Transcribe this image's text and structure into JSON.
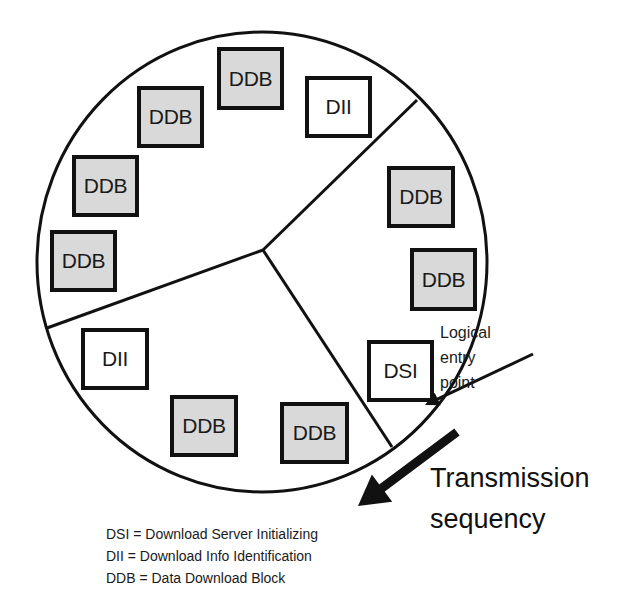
{
  "diagram": {
    "colors": {
      "stroke": "#111111",
      "shaded_block": "#d9d9d9",
      "plain_block": "#ffffff",
      "background": "#ffffff"
    },
    "wheel": {
      "cx": 262,
      "cy": 262,
      "rx": 225,
      "ry": 230,
      "hub": {
        "x": 263,
        "y": 250
      },
      "dividers": [
        {
          "x": 417,
          "y": 100
        },
        {
          "x": 47,
          "y": 328
        },
        {
          "x": 392,
          "y": 447
        }
      ]
    },
    "blocks": [
      {
        "label": "DDB",
        "type": "shaded",
        "x": 217,
        "y": 47,
        "w": 67,
        "h": 63
      },
      {
        "label": "DII",
        "type": "plain",
        "x": 305,
        "y": 76,
        "w": 67,
        "h": 62
      },
      {
        "label": "DDB",
        "type": "shaded",
        "x": 137,
        "y": 86,
        "w": 67,
        "h": 62
      },
      {
        "label": "DDB",
        "type": "shaded",
        "x": 72,
        "y": 155,
        "w": 67,
        "h": 62
      },
      {
        "label": "DDB",
        "type": "shaded",
        "x": 50,
        "y": 230,
        "w": 67,
        "h": 62
      },
      {
        "label": "DDB",
        "type": "shaded",
        "x": 387,
        "y": 166,
        "w": 68,
        "h": 62
      },
      {
        "label": "DDB",
        "type": "shaded",
        "x": 410,
        "y": 248,
        "w": 67,
        "h": 63
      },
      {
        "label": "DSI",
        "type": "plain",
        "x": 367,
        "y": 340,
        "w": 67,
        "h": 62
      },
      {
        "label": "DII",
        "type": "plain",
        "x": 81,
        "y": 328,
        "w": 68,
        "h": 62
      },
      {
        "label": "DDB",
        "type": "shaded",
        "x": 170,
        "y": 395,
        "w": 68,
        "h": 62
      },
      {
        "label": "DDB",
        "type": "shaded",
        "x": 280,
        "y": 402,
        "w": 69,
        "h": 62
      }
    ],
    "entry_point": {
      "lines": [
        "Logical",
        "entry",
        "point"
      ],
      "arrow_from": {
        "x": 533,
        "y": 354
      },
      "arrow_to": {
        "x": 425,
        "y": 405
      }
    },
    "transmission": {
      "lines": [
        "Transmission",
        "sequency"
      ],
      "arrow_from": {
        "x": 457,
        "y": 432
      },
      "arrow_to": {
        "x": 358,
        "y": 506
      }
    },
    "legend": [
      "DSI = Download Server Initializing",
      "DII = Download Info Identification",
      "DDB = Data Download Block"
    ]
  }
}
